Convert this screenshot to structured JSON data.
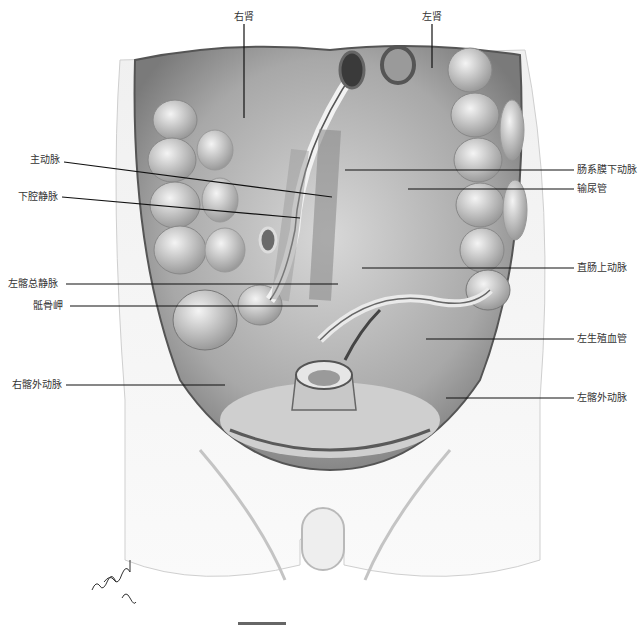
{
  "figure": {
    "signature": "Yury Wind MD",
    "labels": {
      "top": [
        {
          "id": "right-kidney",
          "text": "右肾",
          "x": 244,
          "y": 18,
          "pointer": [
            244,
            22,
            244,
            118
          ]
        },
        {
          "id": "left-kidney",
          "text": "左肾",
          "x": 432,
          "y": 18,
          "pointer": [
            432,
            22,
            432,
            68
          ]
        }
      ],
      "left": [
        {
          "id": "aorta",
          "text": "主动脉",
          "x": 68,
          "y": 160,
          "pointer": [
            64,
            162,
            332,
            197
          ]
        },
        {
          "id": "ivc",
          "text": "下腔静脉",
          "x": 68,
          "y": 197,
          "pointer": [
            62,
            197,
            300,
            218
          ]
        },
        {
          "id": "left-common-iliac-vein",
          "text": "左髂总静脉",
          "x": 68,
          "y": 283,
          "pointer": [
            66,
            284,
            338,
            284
          ]
        },
        {
          "id": "sacral-promontory",
          "text": "骶骨岬",
          "x": 68,
          "y": 305,
          "pointer": [
            68,
            306,
            318,
            306
          ]
        },
        {
          "id": "right-external-iliac-artery",
          "text": "右髂外动脉",
          "x": 68,
          "y": 384,
          "pointer": [
            64,
            385,
            225,
            385
          ]
        }
      ],
      "right": [
        {
          "id": "inferior-mesenteric-artery",
          "text": "肠系膜下动脉",
          "x": 578,
          "y": 170,
          "pointer": [
            345,
            170,
            574,
            170
          ]
        },
        {
          "id": "ureter",
          "text": "输尿管",
          "x": 578,
          "y": 189,
          "pointer": [
            408,
            189,
            574,
            189
          ]
        },
        {
          "id": "superior-rectal-artery",
          "text": "直肠上动脉",
          "x": 578,
          "y": 267,
          "pointer": [
            362,
            268,
            574,
            268
          ]
        },
        {
          "id": "left-gonadal-vessel",
          "text": "左生殖血管",
          "x": 578,
          "y": 338,
          "pointer": [
            426,
            339,
            574,
            339
          ]
        },
        {
          "id": "left-external-iliac-artery",
          "text": "左髂外动脉",
          "x": 578,
          "y": 398,
          "pointer": [
            446,
            398,
            574,
            398
          ]
        }
      ]
    },
    "colors": {
      "background": "#ffffff",
      "label_text": "#333333",
      "leader_line": "#111111",
      "tissue_light": "#e4e4e4",
      "tissue_mid": "#b8b8b8",
      "tissue_dark": "#6e6e6e"
    }
  }
}
